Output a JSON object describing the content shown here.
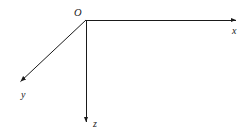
{
  "figure": {
    "kind": "coordinate-axes-diagram",
    "width": 252,
    "height": 140,
    "background_color": "#ffffff",
    "stroke_color": "#1a1a1a",
    "stroke_width": 1
  },
  "origin": {
    "label": "O",
    "x": 86,
    "y": 20
  },
  "axes": [
    {
      "id": "x",
      "label": "x",
      "from_x": 86,
      "from_y": 20,
      "to_x": 240,
      "to_y": 20,
      "direction": "right",
      "label_x": 232,
      "label_y": 26,
      "arrowhead": "filled-triangle"
    },
    {
      "id": "y",
      "label": "y",
      "from_x": 86,
      "from_y": 20,
      "to_x": 16,
      "to_y": 86,
      "direction": "down-left",
      "label_x": 21,
      "label_y": 90,
      "arrowhead": "filled-triangle"
    },
    {
      "id": "z",
      "label": "z",
      "from_x": 86,
      "from_y": 20,
      "to_x": 86,
      "to_y": 126,
      "direction": "down",
      "label_x": 93,
      "label_y": 119,
      "arrowhead": "filled-triangle"
    }
  ]
}
